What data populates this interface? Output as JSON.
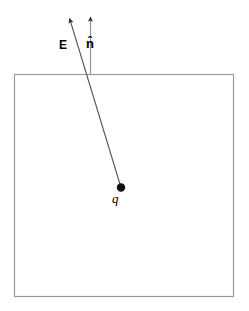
{
  "figure": {
    "canvas": {
      "width": 249,
      "height": 311,
      "background": "#ffffff"
    },
    "colors": {
      "surface_stroke": "#9a9a9a",
      "vector_stroke": "#555555",
      "charge_fill": "#111111",
      "label_text": "#000000"
    },
    "labels": {
      "field_vector": "E",
      "normal_vector": "n̂",
      "charge": "q"
    },
    "surface": {
      "name": "gaussian-surface",
      "shape": "rectangle",
      "x": 14.5,
      "y": 74.5,
      "width": 219,
      "height": 222,
      "stroke_width": 1.2
    },
    "charge": {
      "name": "point-charge",
      "cx": 121,
      "cy": 187.5,
      "r": 4.2
    },
    "vectors": [
      {
        "name": "electric-field-vector",
        "label": "E",
        "x1": 121,
        "y1": 187.5,
        "x2": 68.5,
        "y2": 15,
        "stroke_width": 1.1,
        "arrowhead": true
      },
      {
        "name": "unit-normal-vector",
        "label": "n̂",
        "x1": 90.5,
        "y1": 74.5,
        "x2": 90.5,
        "y2": 13,
        "stroke_width": 1.1,
        "arrowhead": true
      }
    ],
    "label_positions": {
      "E": {
        "x": 59,
        "y": 39
      },
      "nhat": {
        "x": 86,
        "y": 37
      },
      "q": {
        "x": 112,
        "y": 192
      }
    }
  }
}
